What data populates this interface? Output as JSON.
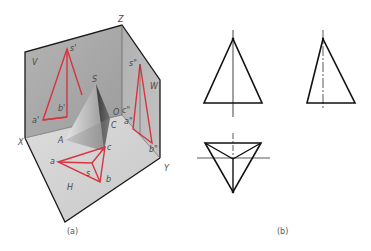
{
  "figure": {
    "panel_a": {
      "caption": "(a)",
      "planes": {
        "V": "V",
        "W": "W",
        "H": "H"
      },
      "axes": {
        "X": "X",
        "Y": "Y",
        "Z": "Z",
        "O": "O"
      },
      "pyramid_labels": {
        "S": "S",
        "A": "A",
        "C": "C"
      },
      "v_projection": {
        "s": "s'",
        "a": "a'",
        "b": "b'"
      },
      "h_projection": {
        "a": "a",
        "b": "b",
        "c": "c",
        "s": "s"
      },
      "w_projection": {
        "s": "s\"",
        "a": "a\"",
        "b": "b\"",
        "c": "c\""
      },
      "colors": {
        "projection": "#d9333f",
        "plane": "#a8a8a8",
        "floor": "#d6d6d6",
        "edge": "#1a1a1a"
      }
    },
    "panel_b": {
      "caption": "(b)",
      "views": [
        "front view",
        "side view",
        "top view"
      ]
    }
  }
}
